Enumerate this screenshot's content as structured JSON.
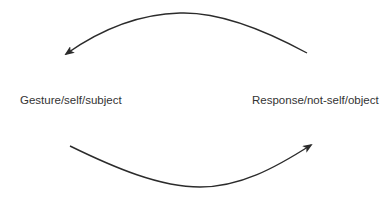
{
  "diagram": {
    "nodes": [
      {
        "id": "left",
        "label": "Gesture/self/subject"
      },
      {
        "id": "right",
        "label": "Response/not-self/object"
      }
    ],
    "edges": [
      {
        "from": "right",
        "to": "left",
        "position": "top",
        "style": "curved-arrow"
      },
      {
        "from": "left",
        "to": "right",
        "position": "bottom",
        "style": "curved-arrow"
      }
    ],
    "colors": {
      "stroke": "#2b2b2b",
      "text": "#333333",
      "background": "#ffffff"
    }
  }
}
